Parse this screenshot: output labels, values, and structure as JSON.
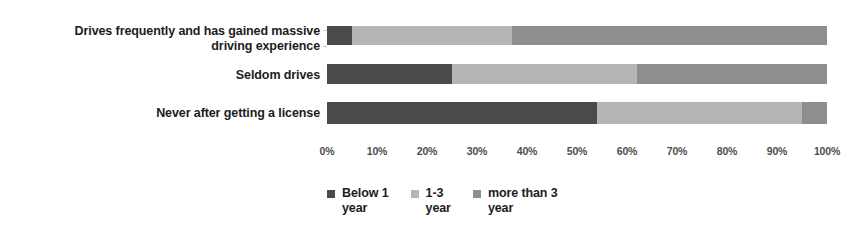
{
  "chart_data": {
    "type": "bar",
    "orientation": "horizontal",
    "stacked": true,
    "normalized_percent": true,
    "title": "",
    "subtitle": "",
    "xlabel": "",
    "ylabel": "",
    "xlim": [
      0,
      100
    ],
    "grid": false,
    "legend_position": "bottom",
    "categories": [
      "Drives frequently and has gained massive driving experience",
      "Seldom drives",
      "Never after getting a license"
    ],
    "xtick_labels": [
      "0%",
      "10%",
      "20%",
      "30%",
      "40%",
      "50%",
      "60%",
      "70%",
      "80%",
      "90%",
      "100%"
    ],
    "xtick_values": [
      0,
      10,
      20,
      30,
      40,
      50,
      60,
      70,
      80,
      90,
      100
    ],
    "series": [
      {
        "name": "Below 1 year",
        "color": "#4a4a4a",
        "values": [
          5,
          25,
          54
        ]
      },
      {
        "name": "1-3 year",
        "color": "#b5b5b5",
        "values": [
          32,
          37,
          41
        ]
      },
      {
        "name": "more than 3 year",
        "color": "#8e8e8e",
        "values": [
          63,
          38,
          5
        ]
      }
    ]
  },
  "legend": {
    "items": [
      {
        "label": "Below 1\nyear",
        "color": "#4a4a4a",
        "marker": "square-swatch"
      },
      {
        "label": "1-3\nyear",
        "color": "#b5b5b5",
        "marker": "square-swatch"
      },
      {
        "label": "more than 3\nyear",
        "color": "#8e8e8e",
        "marker": "square-swatch"
      }
    ]
  },
  "axis": {
    "ticks": [
      {
        "label": "0%",
        "pct": 0
      },
      {
        "label": "10%",
        "pct": 10
      },
      {
        "label": "20%",
        "pct": 20
      },
      {
        "label": "30%",
        "pct": 30
      },
      {
        "label": "40%",
        "pct": 40
      },
      {
        "label": "50%",
        "pct": 50
      },
      {
        "label": "60%",
        "pct": 60
      },
      {
        "label": "70%",
        "pct": 70
      },
      {
        "label": "80%",
        "pct": 80
      },
      {
        "label": "90%",
        "pct": 90
      },
      {
        "label": "100%",
        "pct": 100
      }
    ]
  },
  "categories": {
    "row0_line1": "Drives frequently and has gained massive",
    "row0_line2": "driving experience",
    "row1": "Seldom drives",
    "row2": "Never after getting a license"
  }
}
